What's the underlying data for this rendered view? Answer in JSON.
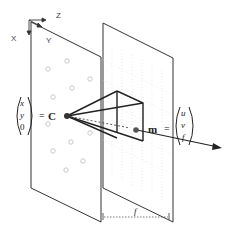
{
  "diagram": {
    "type": "pinhole-camera-model",
    "axes": {
      "x": "X",
      "y": "Y",
      "z": "Z"
    },
    "labels": {
      "world_vector": [
        "x",
        "y",
        "0"
      ],
      "equals": "=",
      "camera_center": "C",
      "image_point": "m",
      "image_vector": [
        "u",
        "v",
        "f"
      ],
      "focal_length": "f"
    },
    "colors": {
      "line": "#222222",
      "plane": "#333333",
      "grid": "#cccccc",
      "dots": "#bbbbbb"
    }
  }
}
